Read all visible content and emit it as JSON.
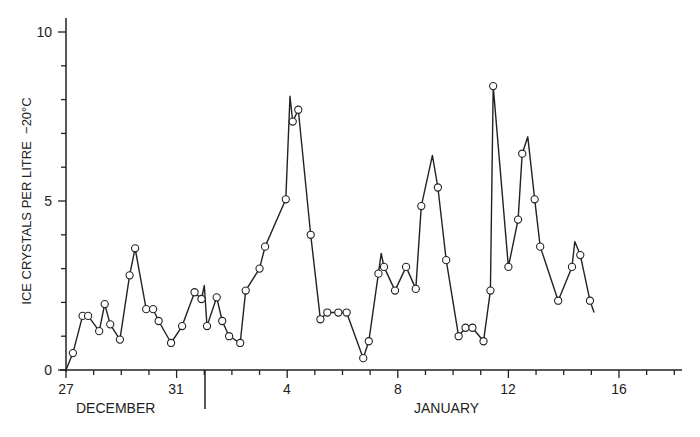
{
  "chart_data": {
    "type": "line",
    "title": "",
    "ylabel": "ICE CRYSTALS PER LITRE  −20°C",
    "xlabel": "",
    "ylim": [
      0,
      10
    ],
    "yticks": [
      "0",
      "5",
      "10"
    ],
    "xtick_labels": [
      "27",
      "31",
      "4",
      "8",
      "12",
      "16"
    ],
    "month_labels": [
      "DECEMBER",
      "JANUARY"
    ],
    "grid": false,
    "legend": null,
    "x_day_index_note": "0 = 27 December; 5 = 1 January",
    "points": [
      [
        0.25,
        0.5
      ],
      [
        0.6,
        1.6
      ],
      [
        0.8,
        1.6
      ],
      [
        1.2,
        1.15
      ],
      [
        1.4,
        1.95
      ],
      [
        1.6,
        1.35
      ],
      [
        1.95,
        0.9
      ],
      [
        2.3,
        2.8
      ],
      [
        2.5,
        3.6
      ],
      [
        2.9,
        1.8
      ],
      [
        3.15,
        1.8
      ],
      [
        3.35,
        1.45
      ],
      [
        3.8,
        0.8
      ],
      [
        4.2,
        1.3
      ],
      [
        4.65,
        2.3
      ],
      [
        4.9,
        2.1
      ],
      [
        5.1,
        1.3
      ],
      [
        5.45,
        2.15
      ],
      [
        5.65,
        1.45
      ],
      [
        5.9,
        1.0
      ],
      [
        6.3,
        0.8
      ],
      [
        6.5,
        2.35
      ],
      [
        7.0,
        3.0
      ],
      [
        7.2,
        3.65
      ],
      [
        7.95,
        5.05
      ],
      [
        8.2,
        7.35
      ],
      [
        8.4,
        7.7
      ],
      [
        8.85,
        4.0
      ],
      [
        9.2,
        1.5
      ],
      [
        9.45,
        1.7
      ],
      [
        9.85,
        1.7
      ],
      [
        10.15,
        1.7
      ],
      [
        10.75,
        0.35
      ],
      [
        10.95,
        0.85
      ],
      [
        11.3,
        2.85
      ],
      [
        11.5,
        3.05
      ],
      [
        11.9,
        2.35
      ],
      [
        12.3,
        3.05
      ],
      [
        12.65,
        2.4
      ],
      [
        12.85,
        4.85
      ],
      [
        13.45,
        5.4
      ],
      [
        13.75,
        3.25
      ],
      [
        14.2,
        1.0
      ],
      [
        14.45,
        1.25
      ],
      [
        14.7,
        1.25
      ],
      [
        15.1,
        0.85
      ],
      [
        15.35,
        2.35
      ],
      [
        15.45,
        8.4
      ],
      [
        16.0,
        3.05
      ],
      [
        16.35,
        4.45
      ],
      [
        16.5,
        6.4
      ],
      [
        16.95,
        5.05
      ],
      [
        17.15,
        3.65
      ],
      [
        17.8,
        2.05
      ],
      [
        18.3,
        3.05
      ],
      [
        18.6,
        3.4
      ],
      [
        18.95,
        2.05
      ]
    ],
    "peaks_unmarked": [
      [
        5.0,
        2.5
      ],
      [
        8.1,
        8.1
      ],
      [
        11.4,
        3.45
      ],
      [
        13.25,
        6.35
      ],
      [
        16.7,
        6.9
      ],
      [
        18.4,
        3.8
      ],
      [
        19.1,
        1.7
      ]
    ]
  },
  "labels": {
    "ylabel": "ICE CRYSTALS PER LITRE  −20°C",
    "y0": "0",
    "y5": "5",
    "y10": "10",
    "x27": "27",
    "x31": "31",
    "x4": "4",
    "x8": "8",
    "x12": "12",
    "x16": "16",
    "dec": "DECEMBER",
    "jan": "JANUARY"
  }
}
